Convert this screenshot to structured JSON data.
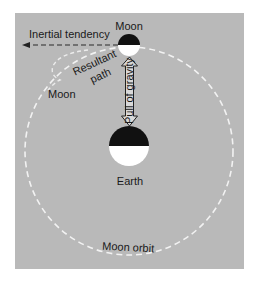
{
  "diagram": {
    "labels": {
      "moon_top": "Moon",
      "inertial_tendency": "Inertial tendency",
      "resultant_path_line1": "Resultant",
      "resultant_path_line2": "path",
      "moon_left": "Moon",
      "pull_of_gravity": "Pull of gravity",
      "earth": "Earth",
      "moon_orbit": "Moon orbit"
    },
    "colors": {
      "background": "#ffffff",
      "panel": "#b9b9b9",
      "dark_half": "#111111",
      "light_half": "#ffffff",
      "orbit_dash": "#f2f2f2",
      "inertia_dash": "#5a5a5a"
    }
  }
}
